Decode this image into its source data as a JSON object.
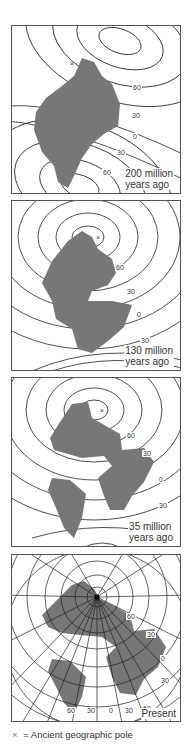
{
  "figure": {
    "panels": [
      {
        "id": "p200",
        "age_line1": "200 million",
        "age_line2": "years ago",
        "latitude_labels": [
          "60",
          "30",
          "0",
          "30",
          "60"
        ]
      },
      {
        "id": "p130",
        "age_line1": "130 million",
        "age_line2": "years ago",
        "latitude_labels": [
          "60",
          "30",
          "0",
          "30"
        ]
      },
      {
        "id": "p35",
        "age_line1": "35 million",
        "age_line2": "years ago",
        "latitude_labels": [
          "60",
          "30",
          "0",
          "30"
        ]
      },
      {
        "id": "present",
        "age_label": "Present",
        "latitude_labels": [
          "60",
          "30",
          "0",
          "30"
        ],
        "longitude_labels": [
          "60",
          "30",
          "0",
          "30",
          "60"
        ]
      }
    ],
    "legend": {
      "symbol": "×",
      "text": "= Ancient geographic pole"
    },
    "colors": {
      "land": "#777777",
      "lines": "#222222",
      "border": "#555555"
    }
  }
}
